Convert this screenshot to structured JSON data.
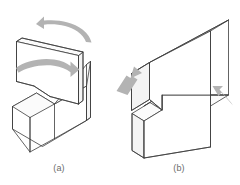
{
  "figure": {
    "type": "technical-line-diagram",
    "background_color": "#ffffff",
    "outline_color": "#3c3c3c",
    "face_fill_color": "#ffffff",
    "shade_fill_color": "#fafafa",
    "arrow_color": "#b3b3b3",
    "caption_color": "#6b6b6b",
    "subfigures": [
      {
        "id": "a",
        "label": "(a)",
        "description": "Two interlocking stepped blocks shown separated, with curved motion arrows indicating rotation and sliding assembly",
        "arrows": [
          {
            "name": "rotation-arrow-top",
            "style": "curved",
            "direction": "left",
            "color": "#b3b3b3"
          },
          {
            "name": "slide-arrow-middle",
            "style": "curved",
            "direction": "right",
            "color": "#b3b3b3"
          }
        ]
      },
      {
        "id": "b",
        "label": "(b)",
        "description": "Two stepped blocks mated into a lap joint, with two straight arrows indicating compressive closing directions",
        "arrows": [
          {
            "name": "push-arrow-left",
            "style": "straight",
            "direction": "up-right",
            "color": "#b3b3b3"
          },
          {
            "name": "push-arrow-right",
            "style": "straight",
            "direction": "up-left",
            "color": "#b3b3b3"
          }
        ]
      }
    ]
  },
  "captions": {
    "a": "(a)",
    "b": "(b)"
  }
}
